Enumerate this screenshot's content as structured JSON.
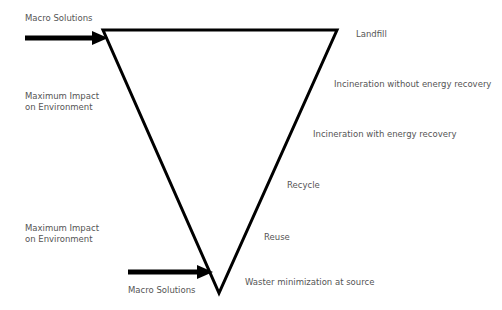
{
  "diagram": {
    "type": "inverted-triangle-hierarchy",
    "colors": {
      "stroke": "#000000",
      "text": "#555555",
      "background": "#ffffff"
    },
    "top_left_label": "Macro Solutions",
    "top_left_impact": "Maximum Impact\non Environment",
    "bottom_left_impact": "Maximum Impact\non Environment",
    "bottom_label": "Macro Solutions",
    "levels": [
      "Landfill",
      "Incineration without energy recovery",
      "Incineration with energy recovery",
      "Recycle",
      "Reuse",
      "Waster minimization at source"
    ]
  }
}
